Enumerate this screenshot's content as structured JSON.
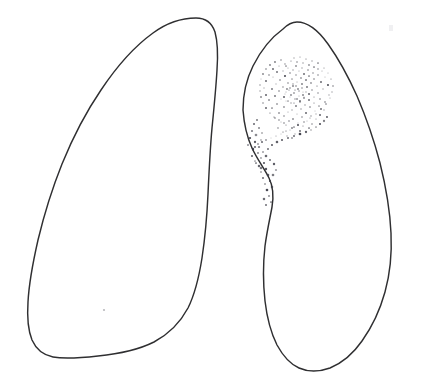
{
  "figure": {
    "title": "Hand-drawn bilateral lung outline diagram",
    "caption": "",
    "background_color": "#ffffff",
    "stroke_color": "#2f2f31",
    "stipple_color": "#3a3a44",
    "width": 428,
    "height": 383,
    "medium": "pen-and-ink line drawing"
  },
  "chart_data": {
    "type": "diagram",
    "title": "Hand-drawn bilateral lung outline diagram",
    "xlabel": "",
    "ylabel": "",
    "grid": false,
    "legend": "none",
    "xlim": [
      0,
      428
    ],
    "ylim": [
      0,
      383
    ],
    "regions": [
      {
        "name": "left-lung-field",
        "label": "",
        "apex": [
          196,
          18
        ],
        "bbox": [
          27,
          17,
          222,
          366
        ],
        "filled": false,
        "stroke": "#2f2f31"
      },
      {
        "name": "right-lung-field",
        "label": "",
        "apex": [
          297,
          22
        ],
        "bbox": [
          243,
          21,
          392,
          372
        ],
        "filled": false,
        "stroke": "#2f2f31"
      }
    ],
    "annotations": [
      {
        "name": "stippled-lesion",
        "label": "",
        "kind": "stipple-cluster",
        "center": [
          293,
          92
        ],
        "bbox": [
          252,
          58,
          335,
          162
        ],
        "dot_count": 248,
        "description": "dense stippled opacity in upper zone of right lung field with a sparse tail trailing inferolaterally"
      },
      {
        "name": "faint-speck-left-base",
        "label": "",
        "kind": "speck",
        "center": [
          104,
          310
        ],
        "bbox": [
          102,
          308,
          107,
          313
        ],
        "dot_count": 1,
        "description": "isolated faint pen speck in left lower lung field"
      }
    ]
  },
  "stipple": {
    "dense_cluster": [
      [
        291,
        61
      ],
      [
        297,
        62
      ],
      [
        303,
        63
      ],
      [
        285,
        64
      ],
      [
        309,
        65
      ],
      [
        279,
        66
      ],
      [
        296,
        66
      ],
      [
        314,
        67
      ],
      [
        288,
        68
      ],
      [
        302,
        68
      ],
      [
        273,
        69
      ],
      [
        318,
        69
      ],
      [
        293,
        70
      ],
      [
        308,
        70
      ],
      [
        283,
        71
      ],
      [
        299,
        71
      ],
      [
        322,
        71
      ],
      [
        277,
        72
      ],
      [
        313,
        73
      ],
      [
        290,
        73
      ],
      [
        304,
        74
      ],
      [
        269,
        75
      ],
      [
        296,
        75
      ],
      [
        318,
        75
      ],
      [
        285,
        76
      ],
      [
        309,
        76
      ],
      [
        325,
        77
      ],
      [
        273,
        77
      ],
      [
        301,
        78
      ],
      [
        292,
        79
      ],
      [
        314,
        79
      ],
      [
        280,
        80
      ],
      [
        306,
        80
      ],
      [
        266,
        81
      ],
      [
        297,
        82
      ],
      [
        321,
        82
      ],
      [
        288,
        83
      ],
      [
        311,
        83
      ],
      [
        276,
        84
      ],
      [
        302,
        84
      ],
      [
        328,
        85
      ],
      [
        293,
        86
      ],
      [
        317,
        86
      ],
      [
        283,
        87
      ],
      [
        307,
        87
      ],
      [
        264,
        88
      ],
      [
        298,
        89
      ],
      [
        323,
        89
      ],
      [
        272,
        89
      ],
      [
        289,
        90
      ],
      [
        312,
        90
      ],
      [
        279,
        91
      ],
      [
        303,
        92
      ],
      [
        294,
        93
      ],
      [
        318,
        93
      ],
      [
        285,
        94
      ],
      [
        309,
        94
      ],
      [
        266,
        95
      ],
      [
        329,
        95
      ],
      [
        299,
        96
      ],
      [
        275,
        96
      ],
      [
        290,
        97
      ],
      [
        314,
        97
      ],
      [
        304,
        98
      ],
      [
        281,
        99
      ],
      [
        295,
        99
      ],
      [
        320,
        99
      ],
      [
        269,
        100
      ],
      [
        309,
        100
      ],
      [
        286,
        101
      ],
      [
        300,
        102
      ],
      [
        325,
        102
      ],
      [
        291,
        103
      ],
      [
        314,
        103
      ],
      [
        277,
        104
      ],
      [
        305,
        105
      ],
      [
        296,
        106
      ],
      [
        319,
        106
      ],
      [
        284,
        107
      ],
      [
        310,
        107
      ],
      [
        272,
        108
      ],
      [
        301,
        109
      ],
      [
        292,
        110
      ],
      [
        324,
        110
      ],
      [
        315,
        111
      ],
      [
        288,
        112
      ],
      [
        279,
        113
      ],
      [
        306,
        113
      ],
      [
        297,
        114
      ],
      [
        320,
        115
      ],
      [
        284,
        116
      ],
      [
        311,
        116
      ],
      [
        302,
        117
      ],
      [
        275,
        118
      ],
      [
        293,
        119
      ],
      [
        316,
        119
      ],
      [
        289,
        121
      ],
      [
        307,
        121
      ],
      [
        281,
        122
      ],
      [
        298,
        123
      ],
      [
        312,
        124
      ],
      [
        286,
        125
      ],
      [
        303,
        126
      ],
      [
        294,
        127
      ],
      [
        309,
        128
      ],
      [
        278,
        128
      ],
      [
        290,
        130
      ],
      [
        300,
        131
      ],
      [
        283,
        132
      ],
      [
        295,
        134
      ],
      [
        287,
        136
      ],
      [
        292,
        138
      ],
      [
        286,
        66
      ],
      [
        300,
        57
      ],
      [
        294,
        58
      ],
      [
        306,
        59
      ],
      [
        312,
        61
      ],
      [
        318,
        63
      ],
      [
        324,
        68
      ],
      [
        328,
        73
      ],
      [
        331,
        79
      ],
      [
        333,
        86
      ],
      [
        332,
        92
      ],
      [
        330,
        98
      ],
      [
        326,
        104
      ],
      [
        321,
        109
      ],
      [
        316,
        114
      ],
      [
        310,
        118
      ],
      [
        304,
        122
      ],
      [
        298,
        125
      ],
      [
        292,
        128
      ],
      [
        286,
        131
      ],
      [
        281,
        134
      ],
      [
        276,
        136
      ],
      [
        271,
        138
      ],
      [
        266,
        140
      ],
      [
        262,
        142
      ],
      [
        258,
        144
      ],
      [
        255,
        147
      ],
      [
        253,
        150
      ],
      [
        281,
        60
      ],
      [
        275,
        62
      ],
      [
        270,
        65
      ],
      [
        266,
        69
      ],
      [
        263,
        74
      ],
      [
        261,
        79
      ],
      [
        260,
        85
      ],
      [
        260,
        91
      ],
      [
        261,
        97
      ],
      [
        263,
        103
      ],
      [
        266,
        108
      ],
      [
        270,
        113
      ],
      [
        274,
        117
      ],
      [
        279,
        120
      ],
      [
        284,
        123
      ],
      [
        296,
        86
      ],
      [
        290,
        88
      ],
      [
        302,
        88
      ],
      [
        286,
        92
      ],
      [
        306,
        92
      ],
      [
        284,
        97
      ],
      [
        304,
        97
      ],
      [
        288,
        101
      ],
      [
        300,
        101
      ],
      [
        294,
        103
      ],
      [
        293,
        84
      ],
      [
        299,
        91
      ],
      [
        291,
        95
      ],
      [
        297,
        99
      ],
      [
        287,
        89
      ],
      [
        303,
        95
      ],
      [
        295,
        90
      ]
    ],
    "sparse_tail": [
      [
        257,
        120
      ],
      [
        254,
        124
      ],
      [
        259,
        128
      ],
      [
        252,
        131
      ],
      [
        256,
        135
      ],
      [
        262,
        133
      ],
      [
        250,
        138
      ],
      [
        255,
        142
      ],
      [
        261,
        140
      ],
      [
        248,
        145
      ],
      [
        253,
        149
      ],
      [
        259,
        147
      ],
      [
        258,
        153
      ],
      [
        252,
        156
      ],
      [
        263,
        152
      ],
      [
        261,
        158
      ],
      [
        255,
        161
      ],
      [
        266,
        156
      ],
      [
        268,
        149
      ],
      [
        272,
        145
      ],
      [
        277,
        142
      ],
      [
        282,
        140
      ],
      [
        288,
        138
      ],
      [
        294,
        136
      ],
      [
        300,
        134
      ],
      [
        306,
        132
      ],
      [
        311,
        130
      ],
      [
        316,
        127
      ],
      [
        320,
        124
      ],
      [
        324,
        121
      ],
      [
        327,
        117
      ],
      [
        264,
        163
      ],
      [
        259,
        166
      ],
      [
        266,
        169
      ],
      [
        261,
        172
      ],
      [
        268,
        175
      ],
      [
        263,
        178
      ],
      [
        270,
        181
      ],
      [
        265,
        184
      ],
      [
        272,
        187
      ],
      [
        267,
        190
      ],
      [
        261,
        168
      ],
      [
        256,
        163
      ],
      [
        270,
        160
      ],
      [
        274,
        164
      ],
      [
        276,
        170
      ],
      [
        273,
        175
      ],
      [
        269,
        196
      ],
      [
        264,
        199
      ],
      [
        271,
        202
      ],
      [
        266,
        205
      ]
    ]
  }
}
